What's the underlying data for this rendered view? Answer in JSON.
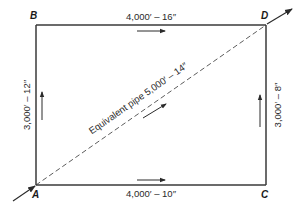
{
  "diagram": {
    "nodes": [
      {
        "id": "A",
        "label": "A",
        "x": 36,
        "y": 185
      },
      {
        "id": "B",
        "label": "B",
        "x": 36,
        "y": 25
      },
      {
        "id": "C",
        "label": "C",
        "x": 266,
        "y": 185
      },
      {
        "id": "D",
        "label": "D",
        "x": 266,
        "y": 25
      }
    ],
    "pipes": [
      {
        "id": "BD",
        "from": "B",
        "to": "D",
        "label": "4,000′ – 16″",
        "flow_direction": "B→D"
      },
      {
        "id": "AC",
        "from": "A",
        "to": "C",
        "label": "4,000′ – 10″",
        "flow_direction": "A→C"
      },
      {
        "id": "AB",
        "from": "A",
        "to": "B",
        "label": "3,000′ – 12″",
        "flow_direction": "A→B"
      },
      {
        "id": "CD",
        "from": "C",
        "to": "D",
        "label": "3,000′ – 8″",
        "flow_direction": "C→D"
      }
    ],
    "equivalent_pipe": {
      "from": "A",
      "to": "D",
      "label": "Equivalent pipe 5,000′ – 14″",
      "style": "dashed",
      "flow_direction": "A→D"
    },
    "inflow": {
      "node": "A",
      "direction": "in"
    },
    "outflow": {
      "node": "D",
      "direction": "out"
    },
    "colors": {
      "line": "#3a3a3a",
      "text": "#1a1a1a",
      "background": "#ffffff"
    }
  }
}
